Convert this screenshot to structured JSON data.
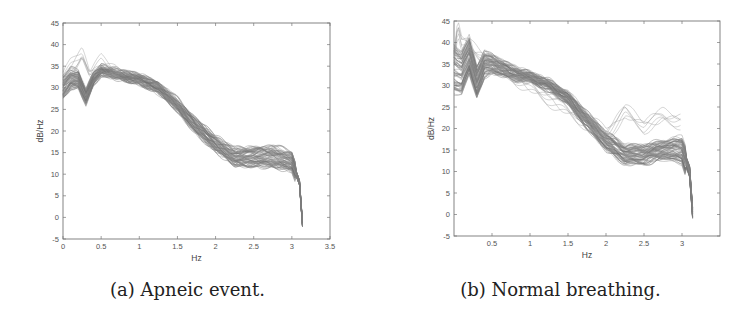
{
  "chart_data": [
    {
      "id": "a",
      "type": "line",
      "caption": "(a) Apneic event.",
      "title": "",
      "xlabel": "Hz",
      "ylabel": "dB/Hz",
      "xlim": [
        0,
        3.5
      ],
      "ylim": [
        -5,
        45
      ],
      "xticks": [
        "0",
        "0.5",
        "1",
        "1.5",
        "2",
        "2.5",
        "3",
        "3.5"
      ],
      "yticks": [
        "-5",
        "0",
        "5",
        "10",
        "15",
        "20",
        "25",
        "30",
        "35",
        "40",
        "45"
      ],
      "grid": false,
      "legend": null,
      "description": "Overlaid power spectral density curves (many traces, gray) for apneic event segments",
      "series": [
        {
          "name": "PSD traces (band center)",
          "x": [
            0,
            0.1,
            0.2,
            0.3,
            0.4,
            0.5,
            0.75,
            1.0,
            1.25,
            1.5,
            1.75,
            2.0,
            2.25,
            2.5,
            2.75,
            3.0,
            3.1,
            3.15
          ],
          "values": [
            30,
            32,
            32,
            28,
            32,
            34,
            33,
            32,
            30,
            26,
            21,
            17,
            14,
            14,
            14,
            13,
            8,
            -4
          ]
        },
        {
          "name": "PSD traces (upper outliers)",
          "x": [
            0,
            0.1,
            0.25,
            0.35,
            0.5,
            0.75
          ],
          "values": [
            33,
            36,
            39,
            34,
            37,
            34
          ]
        }
      ],
      "band_range": {
        "x": [
          0,
          0.5,
          1.0,
          1.5,
          2.0,
          2.5,
          2.75,
          3.0,
          3.1
        ],
        "lower": [
          27,
          33,
          31,
          25,
          15,
          12,
          12,
          11,
          6
        ],
        "upper": [
          33,
          35,
          33,
          28,
          19,
          17,
          18,
          16,
          10
        ]
      }
    },
    {
      "id": "b",
      "type": "line",
      "caption": "(b) Normal breathing.",
      "title": "",
      "xlabel": "Hz",
      "ylabel": "dB/Hz",
      "xlim": [
        0,
        3.5
      ],
      "ylim": [
        -5,
        45
      ],
      "xticks": [
        "0.5",
        "1",
        "1.5",
        "2",
        "2.5",
        "3"
      ],
      "yticks": [
        "-5",
        "0",
        "5",
        "10",
        "15",
        "20",
        "25",
        "30",
        "35",
        "40",
        "45"
      ],
      "grid": false,
      "legend": null,
      "description": "Overlaid power spectral density curves (many traces, gray) for normal breathing segments",
      "series": [
        {
          "name": "PSD traces (band center)",
          "x": [
            0,
            0.1,
            0.2,
            0.3,
            0.4,
            0.5,
            0.75,
            1.0,
            1.25,
            1.5,
            1.75,
            2.0,
            2.25,
            2.5,
            2.75,
            3.0,
            3.1,
            3.15
          ],
          "values": [
            34,
            33,
            37,
            31,
            35,
            35,
            33,
            32,
            30,
            27,
            22,
            17,
            14,
            14,
            15,
            15,
            10,
            -2
          ]
        },
        {
          "name": "PSD traces (upper outliers)",
          "x": [
            0,
            0.05,
            0.1,
            0.2,
            2.0,
            2.25,
            2.5,
            2.75,
            3.0
          ],
          "values": [
            38,
            45,
            41,
            40,
            20,
            25,
            22,
            24,
            23
          ]
        }
      ],
      "band_range": {
        "x": [
          0,
          0.5,
          1.0,
          1.5,
          2.0,
          2.5,
          2.75,
          3.0,
          3.1
        ],
        "lower": [
          25,
          32,
          31,
          25,
          15,
          12,
          13,
          11,
          5
        ],
        "upper": [
          39,
          37,
          33,
          28,
          20,
          17,
          18,
          18,
          14
        ]
      }
    }
  ]
}
